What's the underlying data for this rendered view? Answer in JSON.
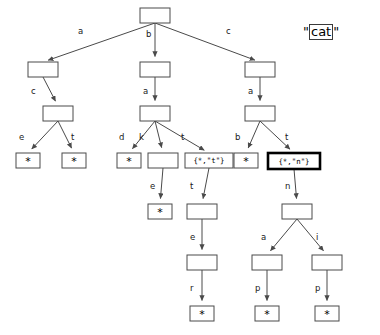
{
  "query": {
    "open_quote": "\"",
    "boxed_text": "cat",
    "close_quote": "\""
  },
  "diagram": {
    "type": "trie-tree",
    "leaf_symbol": "*",
    "nodes": [
      {
        "id": "root",
        "x": 140,
        "y": 8,
        "w": 30,
        "h": 15,
        "kind": "empty",
        "label": ""
      },
      {
        "id": "n-a",
        "x": 28,
        "y": 62,
        "w": 30,
        "h": 15,
        "kind": "empty",
        "label": ""
      },
      {
        "id": "n-b",
        "x": 140,
        "y": 62,
        "w": 30,
        "h": 15,
        "kind": "empty",
        "label": ""
      },
      {
        "id": "n-c",
        "x": 245,
        "y": 62,
        "w": 30,
        "h": 15,
        "kind": "empty",
        "label": ""
      },
      {
        "id": "n-ac",
        "x": 43,
        "y": 106,
        "w": 30,
        "h": 15,
        "kind": "empty",
        "label": ""
      },
      {
        "id": "n-ba",
        "x": 140,
        "y": 106,
        "w": 30,
        "h": 15,
        "kind": "empty",
        "label": ""
      },
      {
        "id": "n-ca",
        "x": 245,
        "y": 106,
        "w": 30,
        "h": 15,
        "kind": "empty",
        "label": ""
      },
      {
        "id": "n-ace",
        "x": 16,
        "y": 153,
        "w": 24,
        "h": 15,
        "kind": "leaf",
        "label": "*"
      },
      {
        "id": "n-act",
        "x": 62,
        "y": 153,
        "w": 24,
        "h": 15,
        "kind": "leaf",
        "label": "*"
      },
      {
        "id": "n-bad",
        "x": 117,
        "y": 153,
        "w": 24,
        "h": 15,
        "kind": "leaf",
        "label": "*"
      },
      {
        "id": "n-bak",
        "x": 148,
        "y": 153,
        "w": 30,
        "h": 15,
        "kind": "empty",
        "label": ""
      },
      {
        "id": "n-bat",
        "x": 185,
        "y": 153,
        "w": 48,
        "h": 15,
        "kind": "set",
        "label": "{*,\"t\"}"
      },
      {
        "id": "n-cab",
        "x": 234,
        "y": 153,
        "w": 24,
        "h": 15,
        "kind": "leaf",
        "label": "*"
      },
      {
        "id": "n-cat",
        "x": 268,
        "y": 153,
        "w": 52,
        "h": 16,
        "kind": "highlight",
        "label": "{*,\"n\"}"
      },
      {
        "id": "n-bake",
        "x": 148,
        "y": 204,
        "w": 24,
        "h": 15,
        "kind": "leaf",
        "label": "*"
      },
      {
        "id": "n-batt",
        "x": 187,
        "y": 204,
        "w": 30,
        "h": 15,
        "kind": "empty",
        "label": ""
      },
      {
        "id": "n-catn",
        "x": 282,
        "y": 204,
        "w": 30,
        "h": 15,
        "kind": "empty",
        "label": ""
      },
      {
        "id": "n-batte",
        "x": 187,
        "y": 255,
        "w": 30,
        "h": 15,
        "kind": "empty",
        "label": ""
      },
      {
        "id": "n-catna",
        "x": 252,
        "y": 255,
        "w": 30,
        "h": 15,
        "kind": "empty",
        "label": ""
      },
      {
        "id": "n-catni",
        "x": 312,
        "y": 255,
        "w": 30,
        "h": 15,
        "kind": "empty",
        "label": ""
      },
      {
        "id": "n-batter",
        "x": 190,
        "y": 306,
        "w": 24,
        "h": 15,
        "kind": "leaf",
        "label": "*"
      },
      {
        "id": "n-catnap",
        "x": 255,
        "y": 306,
        "w": 24,
        "h": 15,
        "kind": "leaf",
        "label": "*"
      },
      {
        "id": "n-catnip",
        "x": 315,
        "y": 306,
        "w": 24,
        "h": 15,
        "kind": "leaf",
        "label": "*"
      }
    ],
    "edges": [
      {
        "id": "e-root-a",
        "from": "root",
        "to": "n-a",
        "label": "a",
        "lx": 78,
        "ly": 34
      },
      {
        "id": "e-root-b",
        "from": "root",
        "to": "n-b",
        "label": "b",
        "lx": 146,
        "ly": 37
      },
      {
        "id": "e-root-c",
        "from": "root",
        "to": "n-c",
        "label": "c",
        "lx": 226,
        "ly": 34
      },
      {
        "id": "e-a-ac",
        "from": "n-a",
        "to": "n-ac",
        "label": "c",
        "lx": 31,
        "ly": 94
      },
      {
        "id": "e-b-ba",
        "from": "n-b",
        "to": "n-ba",
        "label": "a",
        "lx": 143,
        "ly": 94
      },
      {
        "id": "e-c-ca",
        "from": "n-c",
        "to": "n-ca",
        "label": "a",
        "lx": 248,
        "ly": 94
      },
      {
        "id": "e-ac-e",
        "from": "n-ac",
        "to": "n-ace",
        "label": "e",
        "lx": 19,
        "ly": 140
      },
      {
        "id": "e-ac-t",
        "from": "n-ac",
        "to": "n-act",
        "label": "t",
        "lx": 71,
        "ly": 140
      },
      {
        "id": "e-ba-d",
        "from": "n-ba",
        "to": "n-bad",
        "label": "d",
        "lx": 119,
        "ly": 140
      },
      {
        "id": "e-ba-k",
        "from": "n-ba",
        "to": "n-bak",
        "label": "k",
        "lx": 139,
        "ly": 140
      },
      {
        "id": "e-ba-t",
        "from": "n-ba",
        "to": "n-bat",
        "label": "t",
        "lx": 181,
        "ly": 140
      },
      {
        "id": "e-ca-b",
        "from": "n-ca",
        "to": "n-cab",
        "label": "b",
        "lx": 235,
        "ly": 140
      },
      {
        "id": "e-ca-t",
        "from": "n-ca",
        "to": "n-cat",
        "label": "t",
        "lx": 285,
        "ly": 140
      },
      {
        "id": "e-bak-e",
        "from": "n-bak",
        "to": "n-bake",
        "label": "e",
        "lx": 150,
        "ly": 189
      },
      {
        "id": "e-bat-t",
        "from": "n-bat",
        "to": "n-batt",
        "label": "t",
        "lx": 190,
        "ly": 189
      },
      {
        "id": "e-cat-n",
        "from": "n-cat",
        "to": "n-catn",
        "label": "n",
        "lx": 285,
        "ly": 189
      },
      {
        "id": "e-batt-e",
        "from": "n-batt",
        "to": "n-batte",
        "label": "e",
        "lx": 190,
        "ly": 240
      },
      {
        "id": "e-catn-a",
        "from": "n-catn",
        "to": "n-catna",
        "label": "a",
        "lx": 261,
        "ly": 240
      },
      {
        "id": "e-catn-i",
        "from": "n-catn",
        "to": "n-catni",
        "label": "i",
        "lx": 316,
        "ly": 240
      },
      {
        "id": "e-batte-r",
        "from": "n-batte",
        "to": "n-batter",
        "label": "r",
        "lx": 190,
        "ly": 291
      },
      {
        "id": "e-catna-p",
        "from": "n-catna",
        "to": "n-catnap",
        "label": "p",
        "lx": 255,
        "ly": 291
      },
      {
        "id": "e-catni-p",
        "from": "n-catni",
        "to": "n-catnip",
        "label": "p",
        "lx": 315,
        "ly": 291
      }
    ]
  },
  "colors": {
    "stroke": "#4a4a4a",
    "highlight_stroke": "#000000",
    "background": "#ffffff",
    "text": "#000000"
  }
}
